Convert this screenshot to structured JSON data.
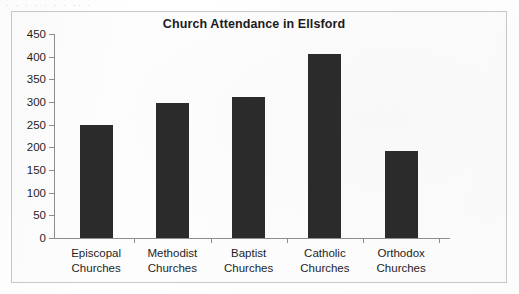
{
  "scan_artifact_text": "·   ·   ·   ·   ·   ·   ·    ·· ·",
  "chart_data": {
    "type": "bar",
    "title": "Church Attendance in Ellsford",
    "xlabel": "",
    "ylabel": "",
    "categories": [
      "Episcopal Churches",
      "Methodist Churches",
      "Baptist Churches",
      "Catholic Churches",
      "Orthodox Churches"
    ],
    "category_lines": [
      [
        "Episcopal",
        "Churches"
      ],
      [
        "Methodist",
        "Churches"
      ],
      [
        "Baptist",
        "Churches"
      ],
      [
        "Catholic",
        "Churches"
      ],
      [
        "Orthodox",
        "Churches"
      ]
    ],
    "values": [
      250,
      298,
      310,
      405,
      193
    ],
    "ylim": [
      0,
      450
    ],
    "ytick_step": 50,
    "yticks": [
      0,
      50,
      100,
      150,
      200,
      250,
      300,
      350,
      400,
      450
    ],
    "ytick_labels": [
      "0",
      "50",
      "100",
      "150",
      "200",
      "250",
      "300",
      "350",
      "400",
      "450"
    ],
    "grid": false,
    "legend": false,
    "bar_color": "#2b2b2b",
    "axis_color": "#8e8e8e",
    "background_color": "#fdfdfd",
    "border_color": "#c9c9c9"
  }
}
